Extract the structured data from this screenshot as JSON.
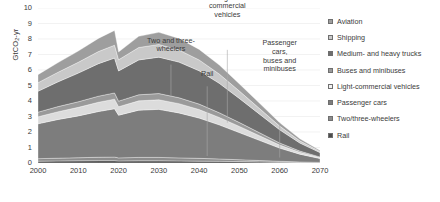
{
  "chart_data": {
    "type": "area",
    "stacked": true,
    "title": "",
    "xlabel": "",
    "ylabel": "GtCO2-yr",
    "ylabel_display": "GtCO₂-yr",
    "xlim": [
      2000,
      2070
    ],
    "ylim": [
      0,
      10
    ],
    "ytick_labels": [
      "0",
      "1",
      "2",
      "3",
      "4",
      "5",
      "6",
      "7",
      "8",
      "9",
      "10"
    ],
    "ytick_values": [
      0,
      1,
      2,
      3,
      4,
      5,
      6,
      7,
      8,
      9,
      10
    ],
    "xtick_labels": [
      "2000",
      "2010",
      "2020",
      "2030",
      "2040",
      "2050",
      "2060",
      "2070"
    ],
    "xtick_values": [
      2000,
      2010,
      2020,
      2030,
      2040,
      2050,
      2060,
      2070
    ],
    "grid": "horizontal",
    "legend_position": "right",
    "x": [
      2000,
      2005,
      2010,
      2015,
      2019,
      2020,
      2025,
      2030,
      2035,
      2040,
      2045,
      2050,
      2055,
      2060,
      2065,
      2070
    ],
    "series": [
      {
        "name": "Rail",
        "color": "#4c4c4c",
        "values": [
          0.12,
          0.13,
          0.14,
          0.15,
          0.15,
          0.13,
          0.14,
          0.14,
          0.13,
          0.12,
          0.11,
          0.09,
          0.07,
          0.05,
          0.03,
          0.02
        ]
      },
      {
        "name": "Two/three-wheelers",
        "color": "#8c8c8c",
        "values": [
          0.16,
          0.18,
          0.2,
          0.22,
          0.23,
          0.2,
          0.22,
          0.22,
          0.2,
          0.18,
          0.15,
          0.12,
          0.09,
          0.06,
          0.04,
          0.02
        ]
      },
      {
        "name": "Passenger cars",
        "color": "#7d7d7d",
        "values": [
          2.25,
          2.5,
          2.7,
          2.95,
          3.12,
          2.75,
          3.05,
          3.1,
          2.9,
          2.6,
          2.2,
          1.75,
          1.3,
          0.85,
          0.5,
          0.25
        ]
      },
      {
        "name": "Light-commercial vehicles",
        "color": "#dcdcdc",
        "values": [
          0.45,
          0.5,
          0.55,
          0.6,
          0.62,
          0.55,
          0.6,
          0.62,
          0.6,
          0.55,
          0.48,
          0.4,
          0.3,
          0.2,
          0.12,
          0.06
        ]
      },
      {
        "name": "Buses and minibuses",
        "color": "#9a9a9a",
        "values": [
          0.3,
          0.33,
          0.36,
          0.39,
          0.4,
          0.36,
          0.39,
          0.4,
          0.38,
          0.35,
          0.3,
          0.25,
          0.19,
          0.13,
          0.08,
          0.04
        ]
      },
      {
        "name": "Medium- and heavy trucks",
        "color": "#6e6e6e",
        "values": [
          1.35,
          1.6,
          1.85,
          2.1,
          2.25,
          1.95,
          2.25,
          2.35,
          2.3,
          2.15,
          1.9,
          1.55,
          1.2,
          0.85,
          0.52,
          0.28
        ]
      },
      {
        "name": "Shipping",
        "color": "#c9c9c9",
        "values": [
          0.55,
          0.62,
          0.7,
          0.78,
          0.83,
          0.72,
          0.8,
          0.82,
          0.78,
          0.7,
          0.6,
          0.48,
          0.36,
          0.24,
          0.14,
          0.07
        ]
      },
      {
        "name": "Aviation",
        "color": "#9e9e9e",
        "values": [
          0.52,
          0.62,
          0.72,
          0.85,
          0.95,
          0.5,
          0.72,
          0.78,
          0.75,
          0.68,
          0.58,
          0.46,
          0.34,
          0.22,
          0.13,
          0.06
        ]
      }
    ],
    "annotations": [
      {
        "text": "Two and three-\nwheelers",
        "x": 2033,
        "y": 7.05,
        "leader_x": 2033,
        "leader_y0": 6.35,
        "leader_y1": 4.3
      },
      {
        "text": "Light-\ncommercial\nvehicles",
        "x": 2047,
        "y": 9.25,
        "leader_x": 2047,
        "leader_y0": 7.3,
        "leader_y1": 2.6
      },
      {
        "text": "Rail",
        "x": 2042,
        "y": 5.45,
        "leader_x": 2042,
        "leader_y0": 4.95,
        "leader_y1": 0.45
      },
      {
        "text": "Passenger\ncars,\nbuses and\nminibuses",
        "x": 2060,
        "y": 5.75,
        "leader_x": 2060,
        "leader_y0": 2.6,
        "leader_y1": 0.35
      }
    ]
  },
  "legend": {
    "items": [
      {
        "label": "Aviation",
        "color": "#9e9e9e"
      },
      {
        "label": "Shipping",
        "color": "#c9c9c9"
      },
      {
        "label": "Medium- and heavy trucks",
        "color": "#6e6e6e"
      },
      {
        "label": "Buses and minibuses",
        "color": "#9a9a9a"
      },
      {
        "label": "Light-commercial vehicles",
        "color": "#f2f2f2"
      },
      {
        "label": "Passenger cars",
        "color": "#7d7d7d"
      },
      {
        "label": "Two/three-wheelers",
        "color": "#8c8c8c"
      },
      {
        "label": "Rail",
        "color": "#4c4c4c"
      }
    ]
  }
}
